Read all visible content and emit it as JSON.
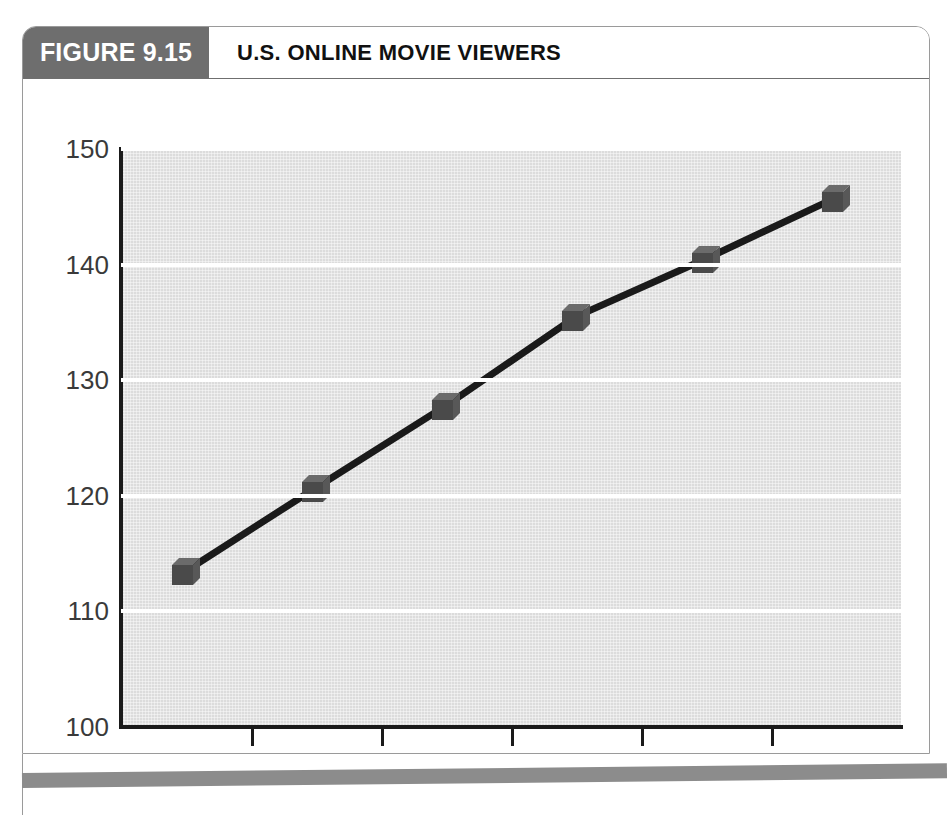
{
  "figure": {
    "number_label": "FIGURE 9.15",
    "title": "U.S. ONLINE MOVIE VIEWERS",
    "header_bg": "#6e6e6e",
    "plot_bg": "#dcdcdc",
    "gridline_color": "#ffffff",
    "series_color": "#1a1a1a",
    "marker_color": "#4a4a4a"
  },
  "chart_data": {
    "type": "line",
    "title": "U.S. ONLINE MOVIE VIEWERS",
    "xlabel": "",
    "ylabel": "",
    "categories": [
      "2015",
      "2016",
      "2017",
      "2018",
      "2019",
      "2020"
    ],
    "values": [
      113.5,
      120.7,
      127.8,
      135.5,
      140.5,
      145.8
    ],
    "series": [
      {
        "name": "U.S. online movie viewers",
        "values": [
          113.5,
          120.7,
          127.8,
          135.5,
          140.5,
          145.8
        ]
      }
    ],
    "ylim": [
      100,
      150
    ],
    "yticks": [
      100,
      110,
      120,
      130,
      140,
      150
    ],
    "ytick_labels": [
      "100",
      "110",
      "120",
      "130",
      "140",
      "150"
    ],
    "xtick_labels": [
      "2015",
      "2016",
      "2017",
      "2018",
      "2019",
      "2020"
    ],
    "grid": true,
    "grid_axis": "y",
    "legend": false,
    "legend_position": "none",
    "marker": "cube-3d"
  }
}
